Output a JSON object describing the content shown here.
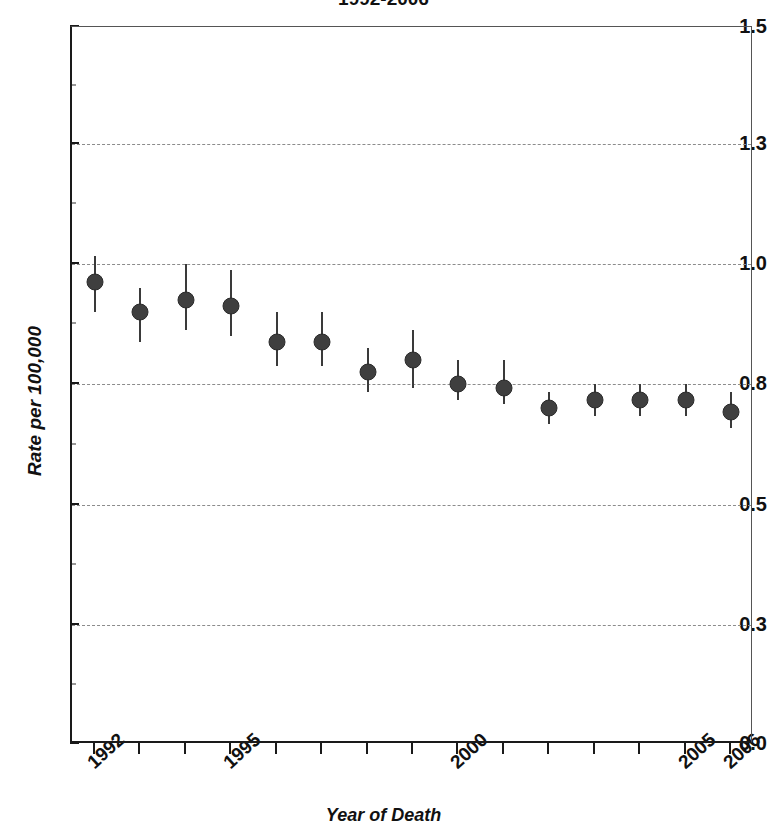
{
  "chart_data": {
    "type": "scatter",
    "title": "1992-2006",
    "xlabel": "Year of Death",
    "ylabel": "Rate per 100,000",
    "grid": true,
    "legend": "none",
    "error_bars": "vertical 95% confidence interval",
    "xlim": [
      1991.5,
      2006.5
    ],
    "ylim": [
      0.0,
      1.5
    ],
    "ytick_labels": [
      "1.5",
      "1.3",
      "1.0",
      "0.8",
      "0.5",
      "0.3",
      "0.0"
    ],
    "ytick_values": [
      1.5,
      1.3,
      1.0,
      0.8,
      0.5,
      0.3,
      0.0
    ],
    "xtick_labels_visible": [
      "1992",
      "1995",
      "2000",
      "2005",
      "2006"
    ],
    "x": [
      1992,
      1993,
      1994,
      1995,
      1996,
      1997,
      1998,
      1999,
      2000,
      2001,
      2002,
      2003,
      2004,
      2005,
      2006
    ],
    "values": [
      0.97,
      0.92,
      0.94,
      0.93,
      0.87,
      0.87,
      0.82,
      0.84,
      0.8,
      0.79,
      0.74,
      0.76,
      0.76,
      0.76,
      0.73
    ],
    "ci_low": [
      0.92,
      0.87,
      0.89,
      0.88,
      0.83,
      0.83,
      0.78,
      0.79,
      0.76,
      0.75,
      0.7,
      0.72,
      0.72,
      0.72,
      0.69
    ],
    "ci_high": [
      1.02,
      0.96,
      1.0,
      0.99,
      0.92,
      0.92,
      0.86,
      0.89,
      0.84,
      0.84,
      0.78,
      0.8,
      0.8,
      0.8,
      0.78
    ],
    "marker_color": "#3f3f3f",
    "gridline_color": "#8c8c8c",
    "axis_color": "#1a1a1a"
  },
  "axis": {
    "y_title": "Rate per 100,000",
    "x_title": "Year of Death"
  },
  "title": "1992-2006"
}
